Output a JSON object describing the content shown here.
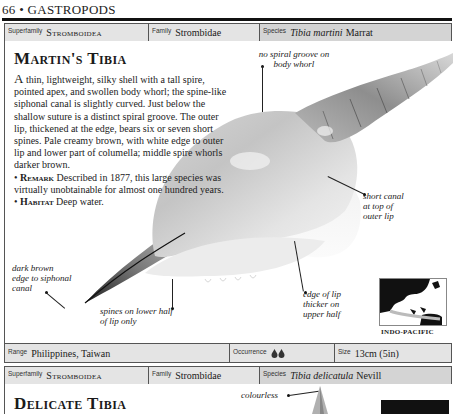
{
  "page": {
    "header": "66 • GASTROPODS"
  },
  "entry1": {
    "taxonomy": {
      "superfamily_label": "Superfamily",
      "superfamily": "Stromboidea",
      "family_label": "Family",
      "family": "Strombidae",
      "species_label": "Species",
      "species_name": "Tibia martini",
      "species_author": "Marrat"
    },
    "title": "Martin's Tibia",
    "description": {
      "dropcap": "A",
      "text": " thin, lightweight, silky shell with a tall spire, pointed apex, and swollen body whorl; the spine-like siphonal canal is slightly curved. Just below the shallow suture is a distinct spiral groove. The outer lip, thickened at the edge, bears six or seven short spines. Pale creamy brown, with white edge to outer lip and lower part of columella; middle spire whorls darker brown.",
      "remark_head": "Remark",
      "remark_text": " Described in 1877, this large species was virtually unobtainable for almost one hundred years.",
      "habitat_head": "Habitat",
      "habitat_text": " Deep water."
    },
    "annotations": {
      "no_spiral_groove": "no spiral groove on body whorl",
      "short_canal": "short canal at top of outer lip",
      "dark_brown_edge": "dark brown edge to siphonal canal",
      "spines_lower_half": "spines on lower half of lip only",
      "edge_thicker": "edge of lip thicker on upper half"
    },
    "map": {
      "label": "INDO-PACIFIC"
    },
    "info": {
      "range_label": "Range",
      "range": "Philippines, Taiwan",
      "occurrence_label": "Occurrence",
      "occurrence_icon": "two-droplets",
      "size_label": "Size",
      "size": "13cm (5in)"
    }
  },
  "entry2": {
    "taxonomy": {
      "superfamily_label": "Superfamily",
      "superfamily": "Stromboidea",
      "family_label": "Family",
      "family": "Strombidae",
      "species_label": "Species",
      "species_name": "Tibia delicatula",
      "species_author": "Nevill"
    },
    "title": "Delicate Tibia",
    "annotations": {
      "colourless": "colourless"
    }
  }
}
